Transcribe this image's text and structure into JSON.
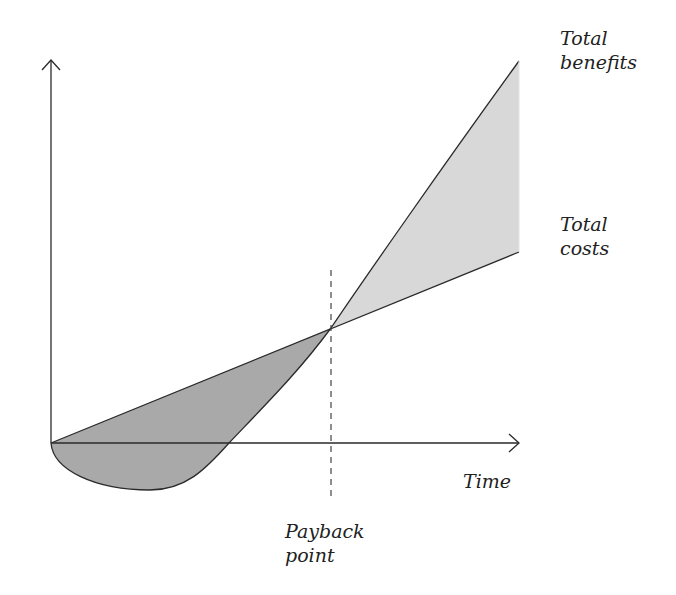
{
  "diagram": {
    "type": "payback-period-diagram",
    "labels": {
      "total_benefits": [
        "Total",
        "benefits"
      ],
      "total_costs": [
        "Total",
        "costs"
      ],
      "x_axis": "Time",
      "payback_point": [
        "Payback",
        "point"
      ]
    },
    "colors": {
      "line": "#2a2a2a",
      "loss_fill": "#a9a9a9",
      "gain_fill": "#d8d8d8",
      "background": "#ffffff"
    },
    "geometry": {
      "origin": [
        51,
        443
      ],
      "y_axis_top": [
        51,
        60
      ],
      "x_axis_end": [
        519,
        443
      ],
      "payback_point": [
        331,
        328
      ],
      "benefits_end": [
        519,
        61
      ],
      "costs_end": [
        519,
        252
      ],
      "benefits_min": [
        150,
        490
      ],
      "benefits_zero_crossing": [
        229,
        443
      ],
      "dashed_line": {
        "x": 331,
        "y_top": 270,
        "y_bottom": 500
      }
    }
  }
}
